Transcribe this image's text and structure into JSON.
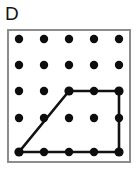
{
  "figure": {
    "label": "D",
    "background_color": "#ffffff",
    "border_color": "#8c8c8c",
    "dot_color": "#0d0d0d",
    "polygon_color": "#121212"
  },
  "panel": {
    "x": 7,
    "y": 29,
    "width": 124,
    "height": 134,
    "border_width": 2
  },
  "grid": {
    "rows": 5,
    "cols": 5,
    "origin_x": 19,
    "origin_y": 39,
    "spacing_x": 25,
    "spacing_y": 28,
    "dot_radius": 4.2,
    "row_y": [
      39,
      67,
      95,
      123,
      152
    ],
    "col_x": [
      19,
      44,
      69,
      94,
      119
    ],
    "points": [
      {
        "row": 0,
        "col": 0,
        "cx": 19,
        "cy": 39
      },
      {
        "row": 0,
        "col": 1,
        "cx": 44,
        "cy": 39
      },
      {
        "row": 0,
        "col": 2,
        "cx": 69,
        "cy": 39
      },
      {
        "row": 0,
        "col": 3,
        "cx": 94,
        "cy": 39
      },
      {
        "row": 0,
        "col": 4,
        "cx": 119,
        "cy": 39
      },
      {
        "row": 1,
        "col": 0,
        "cx": 19,
        "cy": 65
      },
      {
        "row": 1,
        "col": 1,
        "cx": 44,
        "cy": 65
      },
      {
        "row": 1,
        "col": 2,
        "cx": 69,
        "cy": 65
      },
      {
        "row": 1,
        "col": 3,
        "cx": 94,
        "cy": 65
      },
      {
        "row": 1,
        "col": 4,
        "cx": 119,
        "cy": 65
      },
      {
        "row": 2,
        "col": 0,
        "cx": 19,
        "cy": 91
      },
      {
        "row": 2,
        "col": 1,
        "cx": 44,
        "cy": 91
      },
      {
        "row": 2,
        "col": 2,
        "cx": 69,
        "cy": 91
      },
      {
        "row": 2,
        "col": 3,
        "cx": 94,
        "cy": 91
      },
      {
        "row": 2,
        "col": 4,
        "cx": 119,
        "cy": 91
      },
      {
        "row": 3,
        "col": 0,
        "cx": 19,
        "cy": 118
      },
      {
        "row": 3,
        "col": 1,
        "cx": 44,
        "cy": 118
      },
      {
        "row": 3,
        "col": 2,
        "cx": 69,
        "cy": 118
      },
      {
        "row": 3,
        "col": 3,
        "cx": 94,
        "cy": 118
      },
      {
        "row": 3,
        "col": 4,
        "cx": 119,
        "cy": 118
      },
      {
        "row": 4,
        "col": 0,
        "cx": 19,
        "cy": 152
      },
      {
        "row": 4,
        "col": 1,
        "cx": 44,
        "cy": 152
      },
      {
        "row": 4,
        "col": 2,
        "cx": 69,
        "cy": 152
      },
      {
        "row": 4,
        "col": 3,
        "cx": 94,
        "cy": 152
      },
      {
        "row": 4,
        "col": 4,
        "cx": 119,
        "cy": 152
      }
    ]
  },
  "shape": {
    "name": "trapezoid",
    "stroke_width": 2.6,
    "vertices": [
      {
        "label": "bottom-left",
        "row": 4,
        "col": 0,
        "x": 19,
        "y": 152
      },
      {
        "label": "bottom-right",
        "row": 4,
        "col": 4,
        "x": 119,
        "y": 152
      },
      {
        "label": "top-right",
        "row": 2,
        "col": 4,
        "x": 119,
        "y": 91
      },
      {
        "label": "top-left",
        "row": 2,
        "col": 2,
        "x": 69,
        "y": 91
      }
    ],
    "points_attr": "19,152 119,152 119,91 69,91"
  }
}
